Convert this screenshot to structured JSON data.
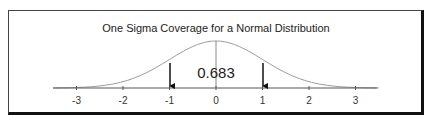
{
  "chart_data": {
    "type": "line",
    "title": "One Sigma Coverage for a Normal Distribution",
    "xlabel": "",
    "ylabel": "",
    "x_ticks": [
      "-3",
      "-2",
      "-1",
      "0",
      "1",
      "2",
      "3"
    ],
    "xlim": [
      -3.5,
      3.5
    ],
    "series": [
      {
        "name": "Standard normal PDF",
        "x": [
          -3,
          -2.5,
          -2,
          -1.5,
          -1,
          -0.5,
          0,
          0.5,
          1,
          1.5,
          2,
          2.5,
          3
        ],
        "y": [
          0.0044,
          0.0175,
          0.054,
          0.1295,
          0.242,
          0.3521,
          0.3989,
          0.3521,
          0.242,
          0.1295,
          0.054,
          0.0175,
          0.0044
        ]
      }
    ],
    "annotations": [
      {
        "type": "arrow",
        "x": -1,
        "direction": "down",
        "label": ""
      },
      {
        "type": "arrow",
        "x": 1,
        "direction": "down",
        "label": ""
      },
      {
        "type": "vline",
        "x": 0
      },
      {
        "type": "text",
        "x": 0,
        "text": "0.683"
      }
    ],
    "grid": false,
    "legend": null,
    "colors": {
      "curve": "#9a9a9a",
      "axis": "#555555",
      "arrow": "#111111",
      "frame": "#111111"
    }
  },
  "labels": {
    "title": "One Sigma Coverage for a Normal Distribution",
    "coverage": "0.683",
    "ticks": [
      "-3",
      "-2",
      "-1",
      "0",
      "1",
      "2",
      "3"
    ]
  }
}
